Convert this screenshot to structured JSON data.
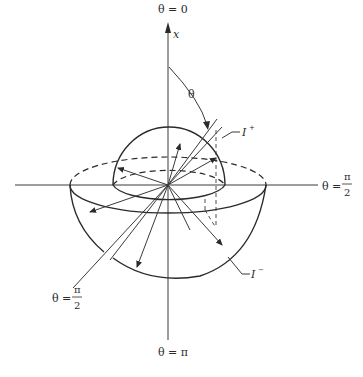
{
  "diagram": {
    "axis": {
      "label": "x",
      "top_label": "θ = 0",
      "bottom_label": "θ = π"
    },
    "labels": {
      "theta": "θ",
      "right_label_prefix": "θ =",
      "right_label_num": "π",
      "right_label_den": "2",
      "left_label_prefix": "θ =",
      "left_label_num": "π",
      "left_label_den": "2",
      "i_plus_base": "I",
      "i_plus_sup": "+",
      "i_minus_base": "I",
      "i_minus_sup": "−"
    },
    "components": [
      "upper hemisphere (I+)",
      "lower hemisphere (I−)",
      "vertical x-axis",
      "horizontal axis",
      "diagonal axis",
      "intensity vectors",
      "polar angle arc θ"
    ]
  }
}
